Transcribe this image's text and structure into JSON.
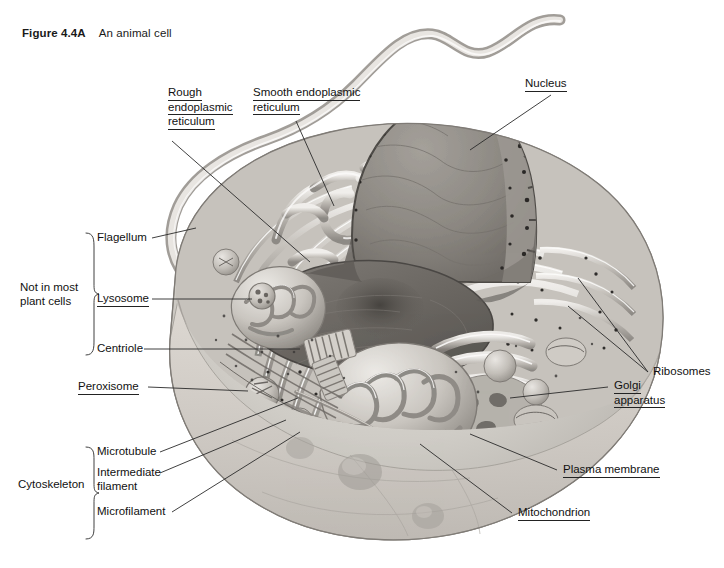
{
  "figure": {
    "number": "Figure 4.4A",
    "caption": "An animal cell",
    "style": "grayscale textbook illustration, cut-away three-dimensional view"
  },
  "colors": {
    "background": "#ffffff",
    "ink": "#111111",
    "leader_line": "#2a2a2a",
    "cytoplasm_light": "#d8d5d0",
    "cytoplasm_mid": "#b5b1ab",
    "membrane_pale": "#e6e3de",
    "organelle_dark": "#6e6a66",
    "nucleus_fill": "#8c8883",
    "nucleus_cut": "#6a6661",
    "nucleolus": "#514e4a"
  },
  "labels": {
    "rough_er": {
      "lines": [
        "Rough",
        "endoplasmic",
        "reticulum"
      ],
      "underlined": true
    },
    "smooth_er": {
      "lines": [
        "Smooth endoplasmic",
        "reticulum"
      ],
      "underlined": true
    },
    "nucleus": {
      "lines": [
        "Nucleus"
      ],
      "underlined": true
    },
    "flagellum": {
      "lines": [
        "Flagellum"
      ],
      "underlined": false
    },
    "lysosome": {
      "lines": [
        "Lysosome"
      ],
      "underlined": true
    },
    "centriole": {
      "lines": [
        "Centriole"
      ],
      "underlined": false
    },
    "peroxisome": {
      "lines": [
        "Peroxisome"
      ],
      "underlined": true
    },
    "microtubule": {
      "lines": [
        "Microtubule"
      ],
      "underlined": false
    },
    "intermediate_filament": {
      "lines": [
        "Intermediate",
        "filament"
      ],
      "underlined": false
    },
    "microfilament": {
      "lines": [
        "Microfilament"
      ],
      "underlined": false
    },
    "ribosomes": {
      "lines": [
        "Ribosomes"
      ],
      "underlined": false
    },
    "golgi": {
      "lines": [
        "Golgi",
        "apparatus"
      ],
      "underlined": true
    },
    "plasma_membrane": {
      "lines": [
        "Plasma membrane"
      ],
      "underlined": true
    },
    "mitochondrion": {
      "lines": [
        "Mitochondrion"
      ],
      "underlined": true
    }
  },
  "groups": {
    "not_in_most_plant_cells": {
      "lines": [
        "Not in most",
        "plant cells"
      ],
      "members": [
        "Flagellum",
        "Lysosome",
        "Centriole"
      ]
    },
    "cytoskeleton": {
      "lines": [
        "Cytoskeleton"
      ],
      "members": [
        "Microtubule",
        "Intermediate filament",
        "Microfilament"
      ]
    }
  },
  "label_text": {
    "rough_er_l1": "Rough",
    "rough_er_l2": "endoplasmic",
    "rough_er_l3": "reticulum",
    "smooth_er_l1": "Smooth endoplasmic",
    "smooth_er_l2": "reticulum",
    "nucleus": "Nucleus",
    "flagellum": "Flagellum",
    "lysosome": "Lysosome",
    "centriole": "Centriole",
    "peroxisome": "Peroxisome",
    "microtubule": "Microtubule",
    "intermediate_l1": "Intermediate",
    "intermediate_l2": "filament",
    "microfilament": "Microfilament",
    "ribosomes": "Ribosomes",
    "golgi_l1": "Golgi",
    "golgi_l2": "apparatus",
    "plasma_membrane": "Plasma membrane",
    "mitochondrion": "Mitochondrion",
    "not_in_most_l1": "Not in most",
    "not_in_most_l2": "plant cells",
    "cytoskeleton": "Cytoskeleton"
  }
}
